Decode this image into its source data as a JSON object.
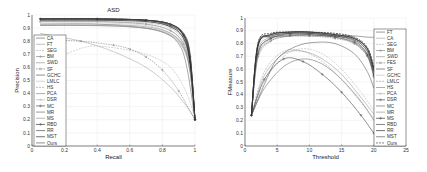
{
  "chart_data": [
    {
      "type": "line",
      "title": "ASD",
      "xlabel": "Recall",
      "ylabel": "Precision",
      "xlim": [
        0,
        1
      ],
      "ylim": [
        0,
        1
      ],
      "xticks": [
        "0",
        "0.2",
        "0.4",
        "0.6",
        "0.8",
        "1"
      ],
      "yticks": [
        "0",
        "0.1",
        "0.2",
        "0.3",
        "0.4",
        "0.5",
        "0.6",
        "0.7",
        "0.8",
        "0.9",
        "1"
      ],
      "grid": true,
      "legend_position": "lower left (inside)",
      "legend": [
        "CA",
        "FT",
        "SEG",
        "BM",
        "SWD",
        "SF",
        "GCHC",
        "LMLC",
        "HS",
        "PCA",
        "DSR",
        "MC",
        "MR",
        "MS",
        "RBD",
        "RR",
        "MST",
        "Ours"
      ],
      "series": [
        {
          "name": "CA",
          "x": [
            0.05,
            0.3,
            0.6,
            0.8,
            0.9,
            0.95,
            1.0
          ],
          "y": [
            0.92,
            0.92,
            0.91,
            0.87,
            0.78,
            0.6,
            0.2
          ]
        },
        {
          "name": "FT",
          "x": [
            0.05,
            0.3,
            0.5,
            0.7,
            0.85,
            0.95,
            1.0
          ],
          "y": [
            0.86,
            0.8,
            0.72,
            0.6,
            0.45,
            0.3,
            0.2
          ]
        },
        {
          "name": "SEG",
          "x": [
            0.2,
            0.35,
            0.5,
            0.7,
            0.85,
            0.95,
            1.0
          ],
          "y": [
            0.7,
            0.76,
            0.75,
            0.7,
            0.6,
            0.4,
            0.2
          ]
        },
        {
          "name": "BM",
          "x": [
            0.05,
            0.4,
            0.7,
            0.85,
            0.93,
            0.97,
            1.0
          ],
          "y": [
            0.95,
            0.95,
            0.93,
            0.88,
            0.78,
            0.6,
            0.2
          ]
        },
        {
          "name": "SWD",
          "x": [
            0.05,
            0.4,
            0.7,
            0.85,
            0.93,
            0.97,
            1.0
          ],
          "y": [
            0.93,
            0.93,
            0.9,
            0.84,
            0.74,
            0.56,
            0.2
          ]
        },
        {
          "name": "SF",
          "x": [
            0.1,
            0.3,
            0.5,
            0.6,
            0.7,
            0.8,
            0.9,
            1.0
          ],
          "y": [
            0.81,
            0.8,
            0.77,
            0.74,
            0.68,
            0.58,
            0.42,
            0.2
          ]
        },
        {
          "name": "GCHC",
          "x": [
            0.05,
            0.4,
            0.7,
            0.85,
            0.93,
            0.97,
            1.0
          ],
          "y": [
            0.96,
            0.96,
            0.95,
            0.91,
            0.82,
            0.62,
            0.2
          ]
        },
        {
          "name": "LMLC",
          "x": [
            0.05,
            0.4,
            0.7,
            0.85,
            0.93,
            0.97,
            1.0
          ],
          "y": [
            0.94,
            0.94,
            0.92,
            0.86,
            0.76,
            0.58,
            0.2
          ]
        },
        {
          "name": "HS",
          "x": [
            0.05,
            0.4,
            0.7,
            0.85,
            0.93,
            0.97,
            1.0
          ],
          "y": [
            0.95,
            0.95,
            0.93,
            0.88,
            0.78,
            0.6,
            0.2
          ]
        },
        {
          "name": "PCA",
          "x": [
            0.05,
            0.4,
            0.7,
            0.85,
            0.93,
            0.97,
            1.0
          ],
          "y": [
            0.93,
            0.93,
            0.91,
            0.86,
            0.76,
            0.57,
            0.2
          ]
        },
        {
          "name": "DSR",
          "x": [
            0.05,
            0.4,
            0.7,
            0.85,
            0.93,
            0.97,
            1.0
          ],
          "y": [
            0.95,
            0.95,
            0.94,
            0.9,
            0.8,
            0.62,
            0.2
          ]
        },
        {
          "name": "MC",
          "x": [
            0.05,
            0.4,
            0.7,
            0.85,
            0.93,
            0.97,
            1.0
          ],
          "y": [
            0.97,
            0.97,
            0.96,
            0.92,
            0.84,
            0.64,
            0.2
          ]
        },
        {
          "name": "MR",
          "x": [
            0.05,
            0.4,
            0.7,
            0.85,
            0.93,
            0.97,
            1.0
          ],
          "y": [
            0.97,
            0.97,
            0.96,
            0.92,
            0.84,
            0.66,
            0.2
          ]
        },
        {
          "name": "MS",
          "x": [
            0.05,
            0.4,
            0.7,
            0.85,
            0.93,
            0.97,
            1.0
          ],
          "y": [
            0.92,
            0.92,
            0.9,
            0.85,
            0.75,
            0.57,
            0.2
          ]
        },
        {
          "name": "RBD",
          "x": [
            0.05,
            0.4,
            0.7,
            0.85,
            0.93,
            0.97,
            1.0
          ],
          "y": [
            0.97,
            0.97,
            0.96,
            0.93,
            0.85,
            0.68,
            0.2
          ]
        },
        {
          "name": "RR",
          "x": [
            0.05,
            0.4,
            0.7,
            0.85,
            0.93,
            0.97,
            1.0
          ],
          "y": [
            0.97,
            0.97,
            0.96,
            0.93,
            0.85,
            0.67,
            0.2
          ]
        },
        {
          "name": "MST",
          "x": [
            0.05,
            0.4,
            0.7,
            0.85,
            0.93,
            0.97,
            1.0
          ],
          "y": [
            0.96,
            0.96,
            0.95,
            0.91,
            0.82,
            0.63,
            0.2
          ]
        },
        {
          "name": "Ours",
          "x": [
            0.05,
            0.4,
            0.7,
            0.85,
            0.93,
            0.97,
            1.0
          ],
          "y": [
            0.97,
            0.97,
            0.96,
            0.93,
            0.86,
            0.7,
            0.2
          ]
        }
      ]
    },
    {
      "type": "line",
      "title": "",
      "xlabel": "Threshold",
      "ylabel": "FMeasure",
      "xlim": [
        0,
        25
      ],
      "ylim": [
        0,
        1
      ],
      "xticks": [
        "0",
        "5",
        "10",
        "15",
        "20",
        "25"
      ],
      "yticks": [
        "0",
        "0.1",
        "0.2",
        "0.3",
        "0.4",
        "0.5",
        "0.6",
        "0.7",
        "0.8",
        "0.9",
        "1"
      ],
      "grid": true,
      "legend_position": "right (inside)",
      "legend": [
        "FT",
        "CA",
        "SEG",
        "BM",
        "SWD",
        "FES",
        "SF",
        "GCHC",
        "LMLC",
        "HS",
        "PCA",
        "DSR",
        "MC",
        "MR",
        "MS",
        "RBD",
        "RR",
        "MST",
        "Ours"
      ],
      "series": [
        {
          "name": "FT",
          "x": [
            1,
            3,
            6,
            9,
            12,
            15,
            18,
            20
          ],
          "y": [
            0.24,
            0.45,
            0.62,
            0.68,
            0.64,
            0.52,
            0.35,
            0.2
          ]
        },
        {
          "name": "CA",
          "x": [
            1,
            2,
            4,
            7,
            10,
            14,
            17,
            19,
            20
          ],
          "y": [
            0.24,
            0.68,
            0.82,
            0.86,
            0.87,
            0.85,
            0.8,
            0.7,
            0.55
          ]
        },
        {
          "name": "SEG",
          "x": [
            1,
            3,
            6,
            9,
            12,
            15,
            18,
            20
          ],
          "y": [
            0.24,
            0.5,
            0.7,
            0.76,
            0.72,
            0.6,
            0.42,
            0.28
          ]
        },
        {
          "name": "BM",
          "x": [
            1,
            2,
            4,
            7,
            10,
            14,
            17,
            19,
            20
          ],
          "y": [
            0.24,
            0.72,
            0.84,
            0.88,
            0.88,
            0.86,
            0.82,
            0.72,
            0.56
          ]
        },
        {
          "name": "SWD",
          "x": [
            1,
            3,
            6,
            9,
            12,
            15,
            18,
            20
          ],
          "y": [
            0.24,
            0.55,
            0.72,
            0.74,
            0.68,
            0.56,
            0.38,
            0.25
          ]
        },
        {
          "name": "FES",
          "x": [
            1,
            2,
            4,
            7,
            10,
            14,
            17,
            19,
            20
          ],
          "y": [
            0.24,
            0.7,
            0.82,
            0.86,
            0.86,
            0.84,
            0.8,
            0.7,
            0.54
          ]
        },
        {
          "name": "SF",
          "x": [
            1,
            3,
            5,
            8,
            11,
            14,
            17,
            19,
            20
          ],
          "y": [
            0.24,
            0.48,
            0.68,
            0.78,
            0.81,
            0.8,
            0.72,
            0.58,
            0.45
          ]
        },
        {
          "name": "GCHC",
          "x": [
            1,
            2,
            4,
            7,
            10,
            14,
            17,
            19,
            20
          ],
          "y": [
            0.24,
            0.76,
            0.86,
            0.88,
            0.88,
            0.86,
            0.83,
            0.74,
            0.58
          ]
        },
        {
          "name": "LMLC",
          "x": [
            1,
            3,
            6,
            9,
            12,
            15,
            18,
            20
          ],
          "y": [
            0.24,
            0.58,
            0.74,
            0.74,
            0.66,
            0.52,
            0.34,
            0.22
          ]
        },
        {
          "name": "HS",
          "x": [
            1,
            2,
            4,
            7,
            10,
            14,
            17,
            19,
            20
          ],
          "y": [
            0.24,
            0.74,
            0.85,
            0.88,
            0.88,
            0.86,
            0.82,
            0.72,
            0.56
          ]
        },
        {
          "name": "PCA",
          "x": [
            1,
            2,
            4,
            7,
            10,
            14,
            17,
            19,
            20
          ],
          "y": [
            0.24,
            0.7,
            0.83,
            0.86,
            0.87,
            0.85,
            0.8,
            0.7,
            0.54
          ]
        },
        {
          "name": "DSR",
          "x": [
            1,
            2,
            4,
            7,
            10,
            14,
            17,
            19,
            20
          ],
          "y": [
            0.24,
            0.72,
            0.84,
            0.87,
            0.87,
            0.85,
            0.81,
            0.71,
            0.55
          ]
        },
        {
          "name": "MC",
          "x": [
            1,
            2,
            4,
            7,
            10,
            14,
            17,
            19,
            20
          ],
          "y": [
            0.24,
            0.78,
            0.87,
            0.89,
            0.89,
            0.87,
            0.84,
            0.76,
            0.6
          ]
        },
        {
          "name": "MR",
          "x": [
            1,
            2,
            4,
            7,
            10,
            14,
            17,
            19,
            20
          ],
          "y": [
            0.24,
            0.78,
            0.87,
            0.89,
            0.89,
            0.87,
            0.84,
            0.75,
            0.59
          ]
        },
        {
          "name": "MS",
          "x": [
            1,
            3,
            6,
            9,
            12,
            15,
            18,
            20
          ],
          "y": [
            0.24,
            0.52,
            0.68,
            0.66,
            0.56,
            0.42,
            0.24,
            0.1
          ]
        },
        {
          "name": "RBD",
          "x": [
            1,
            2,
            4,
            7,
            10,
            14,
            17,
            19,
            20
          ],
          "y": [
            0.24,
            0.78,
            0.87,
            0.89,
            0.89,
            0.87,
            0.84,
            0.76,
            0.6
          ]
        },
        {
          "name": "RR",
          "x": [
            1,
            2,
            4,
            7,
            10,
            14,
            17,
            19,
            20
          ],
          "y": [
            0.24,
            0.78,
            0.86,
            0.88,
            0.88,
            0.86,
            0.83,
            0.74,
            0.58
          ]
        },
        {
          "name": "MST",
          "x": [
            1,
            2,
            4,
            7,
            10,
            14,
            17,
            19,
            20
          ],
          "y": [
            0.24,
            0.8,
            0.85,
            0.86,
            0.86,
            0.86,
            0.86,
            0.85,
            0.85
          ]
        },
        {
          "name": "Ours",
          "x": [
            1,
            2,
            4,
            7,
            10,
            14,
            17,
            19,
            20
          ],
          "y": [
            0.24,
            0.8,
            0.88,
            0.89,
            0.89,
            0.88,
            0.85,
            0.77,
            0.62
          ]
        }
      ]
    }
  ]
}
